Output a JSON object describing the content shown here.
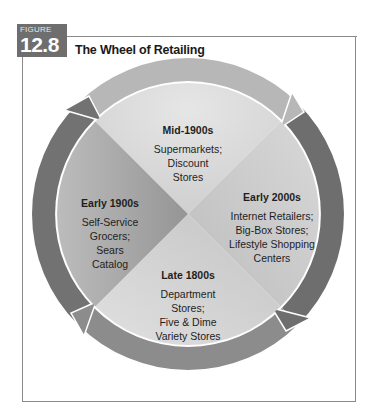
{
  "figure": {
    "label": "FIGURE",
    "number": "12.8",
    "title": "The Wheel of Retailing"
  },
  "wheel": {
    "direction": "clockwise",
    "segments": [
      {
        "position": "top",
        "era": "Mid-1900s",
        "lines": [
          "Supermarkets;",
          "Discount",
          "Stores"
        ],
        "color": "#d9d9d9"
      },
      {
        "position": "right",
        "era": "Early 2000s",
        "lines": [
          "Internet Retailers;",
          "Big-Box Stores;",
          "Lifestyle Shopping",
          "Centers"
        ],
        "color": "#cfcfcf"
      },
      {
        "position": "bottom",
        "era": "Late 1800s",
        "lines": [
          "Department",
          "Stores;",
          "Five & Dime",
          "Variety Stores"
        ],
        "color": "#c8c8c8"
      },
      {
        "position": "left",
        "era": "Early 1900s",
        "lines": [
          "Self-Service",
          "Grocers;",
          "Sears",
          "Catalog"
        ],
        "color": "#a9a9a9"
      }
    ],
    "ring_colors": {
      "top": "#b3b3b3",
      "right": "#6c6c6c",
      "bottom": "#8a8a8a",
      "left": "#6c6c6c"
    }
  }
}
